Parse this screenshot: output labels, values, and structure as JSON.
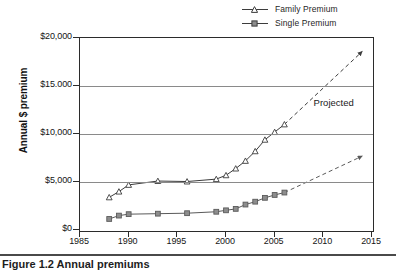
{
  "chart_data": {
    "type": "line",
    "title": "",
    "xlabel": "",
    "ylabel": "Annual $ premium",
    "xlim": [
      1985,
      2015
    ],
    "ylim": [
      0,
      20000
    ],
    "xticks": [
      "1985",
      "1990",
      "1995",
      "2000",
      "2005",
      "2010",
      "2015"
    ],
    "yticks": [
      "$0",
      "$5,000",
      "$10,000",
      "$15.000",
      "$20,000"
    ],
    "ytick_values": [
      0,
      5000,
      10000,
      15000,
      20000
    ],
    "xtick_values": [
      1985,
      1990,
      1995,
      2000,
      2005,
      2010,
      2015
    ],
    "grid": "horizontal",
    "legend_position": "top-right",
    "annotations": [
      {
        "text": "Projected",
        "x": 2009,
        "y": 13200
      }
    ],
    "series": [
      {
        "name": "Family Premium",
        "marker": "triangle",
        "color": "#3c3c3c",
        "x": [
          1988,
          1989,
          1990,
          1993,
          1996,
          1999,
          2000,
          2001,
          2002,
          2003,
          2004,
          2005,
          2006
        ],
        "values": [
          3400,
          4000,
          4700,
          5100,
          5050,
          5300,
          5700,
          6400,
          7200,
          8200,
          9400,
          10200,
          11000
        ],
        "projection": {
          "style": "dashed-arrow",
          "x": [
            2006,
            2014
          ],
          "values": [
            11000,
            18600
          ]
        }
      },
      {
        "name": "Single Premium",
        "marker": "square",
        "color": "#5a5a5a",
        "x": [
          1988,
          1989,
          1990,
          1993,
          1996,
          1999,
          2000,
          2001,
          2002,
          2003,
          2004,
          2005,
          2006
        ],
        "values": [
          1150,
          1500,
          1650,
          1700,
          1750,
          1900,
          2050,
          2200,
          2650,
          2950,
          3350,
          3650,
          3900
        ],
        "projection": {
          "style": "dashed-arrow",
          "x": [
            2006,
            2014
          ],
          "values": [
            3900,
            7700
          ]
        }
      }
    ]
  },
  "legend": {
    "items": [
      {
        "label": "Family Premium",
        "marker": "triangle"
      },
      {
        "label": "Single Premium",
        "marker": "square"
      }
    ]
  },
  "axes": {
    "y_title": "Annual $ premium"
  },
  "annotations": {
    "projected": "Projected"
  },
  "caption": {
    "text": "Figure 1.2   Annual premiums"
  }
}
